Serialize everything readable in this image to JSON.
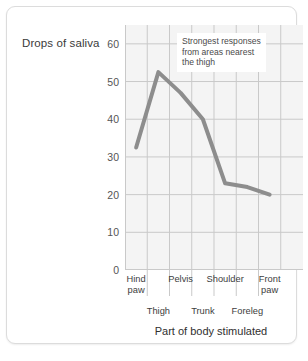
{
  "chart_data": {
    "type": "line",
    "title": "",
    "xlabel": "Part of body stimulated",
    "ylabel": "Drops of saliva",
    "categories": [
      "Hind paw",
      "Thigh",
      "Pelvis",
      "Trunk",
      "Shoulder",
      "Foreleg",
      "Front paw"
    ],
    "values": [
      32.5,
      52.5,
      47,
      40,
      23,
      22,
      20
    ],
    "ylim": [
      0,
      65
    ],
    "yticks": [
      0,
      10,
      20,
      30,
      40,
      50,
      60
    ],
    "ytick_labels": [
      "0",
      "10",
      "20",
      "30",
      "40",
      "50",
      "60"
    ],
    "grid": true,
    "legend": "none",
    "series": [
      {
        "name": "Drops of saliva",
        "color": "#8d8d8d",
        "values": [
          32.5,
          52.5,
          47,
          40,
          23,
          22,
          20
        ]
      }
    ],
    "annotations": [
      {
        "id": "strongest-responses",
        "lines": [
          "Strongest responses",
          "from areas nearest",
          "the thigh"
        ]
      }
    ]
  },
  "axes": {
    "y_title": "Drops of saliva",
    "x_title": "Part of body stimulated",
    "y_ticks": [
      {
        "label": "60",
        "value": 60
      },
      {
        "label": "50",
        "value": 50
      },
      {
        "label": "40",
        "value": 40
      },
      {
        "label": "30",
        "value": 30
      },
      {
        "label": "20",
        "value": 20
      },
      {
        "label": "10",
        "value": 10
      },
      {
        "label": "0",
        "value": 0
      }
    ],
    "x_labels_top": [
      {
        "label": "Hind\npaw",
        "line1": "Hind",
        "line2": "paw"
      },
      {
        "label": "Pelvis",
        "line1": "Pelvis",
        "line2": ""
      },
      {
        "label": "Shoulder",
        "line1": "Shoulder",
        "line2": ""
      },
      {
        "label": "Front\npaw",
        "line1": "Front",
        "line2": "paw"
      }
    ],
    "x_labels_bottom": [
      {
        "label": "Thigh"
      },
      {
        "label": "Trunk"
      },
      {
        "label": "Foreleg"
      }
    ]
  },
  "annotation": {
    "line1": "Strongest responses",
    "line2": "from areas nearest",
    "line3": "the thigh"
  },
  "colors": {
    "series_line": "#8d8d8d",
    "plot_background": "#f4f4f4",
    "grid": "#c9c9c9",
    "card_border": "#dcdcdc",
    "tick_text": "#555555",
    "axis_title_text": "#2f2f2f"
  }
}
